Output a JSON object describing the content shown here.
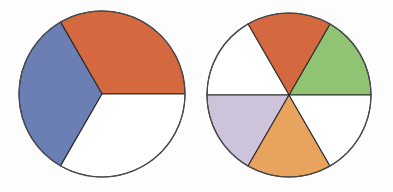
{
  "figure": {
    "background_color": "#fdfdfd",
    "outline_color": "#4a4a52",
    "sector_stroke_color": "#2b2b2b",
    "width": 393,
    "height": 192
  },
  "chart_data": {
    "type": "pie",
    "xlabel": "",
    "ylabel": "",
    "charts": [
      {
        "name": "left-circle",
        "label": "Circle divided into thirds",
        "center_x": 102,
        "center_y": 94,
        "radius": 83,
        "total_sectors": 3,
        "shaded_sectors": 2,
        "fraction": "2/3",
        "start_angle_deg": 0,
        "categories": [
          "orange-sector",
          "blue-sector",
          "white-sector"
        ],
        "values": [
          120,
          120,
          120
        ],
        "series": [
          {
            "name": "sectors",
            "values": [
              {
                "label": "orange-sector",
                "start_deg": 0,
                "end_deg": 120,
                "sweep_deg": 120,
                "color": "#d4693f",
                "shaded": true
              },
              {
                "label": "blue-sector",
                "start_deg": 120,
                "end_deg": 240,
                "sweep_deg": 120,
                "color": "#6b7fb5",
                "shaded": true
              },
              {
                "label": "white-sector",
                "start_deg": 240,
                "end_deg": 360,
                "sweep_deg": 120,
                "color": "#ffffff",
                "shaded": false
              }
            ]
          }
        ]
      },
      {
        "name": "right-circle",
        "label": "Circle divided into sixths",
        "center_x": 289,
        "center_y": 95,
        "radius": 82,
        "total_sectors": 6,
        "shaded_sectors": 4,
        "fraction": "4/6",
        "start_angle_deg": 0,
        "categories": [
          "green-sector",
          "orange-sector",
          "white-sector-upper-left",
          "lavender-sector",
          "light-orange-sector",
          "white-sector-lower-right"
        ],
        "values": [
          60,
          60,
          60,
          60,
          60,
          60
        ],
        "series": [
          {
            "name": "sectors",
            "values": [
              {
                "label": "green-sector",
                "start_deg": 0,
                "end_deg": 60,
                "sweep_deg": 60,
                "color": "#90c473",
                "shaded": true
              },
              {
                "label": "orange-sector",
                "start_deg": 60,
                "end_deg": 120,
                "sweep_deg": 60,
                "color": "#d4693f",
                "shaded": true
              },
              {
                "label": "white-sector-upper-left",
                "start_deg": 120,
                "end_deg": 180,
                "sweep_deg": 60,
                "color": "#ffffff",
                "shaded": false
              },
              {
                "label": "lavender-sector",
                "start_deg": 180,
                "end_deg": 240,
                "sweep_deg": 60,
                "color": "#cdc3da",
                "shaded": true
              },
              {
                "label": "light-orange-sector",
                "start_deg": 240,
                "end_deg": 300,
                "sweep_deg": 60,
                "color": "#e8a35e",
                "shaded": true
              },
              {
                "label": "white-sector-lower-right",
                "start_deg": 300,
                "end_deg": 360,
                "sweep_deg": 60,
                "color": "#ffffff",
                "shaded": false
              }
            ]
          }
        ]
      }
    ],
    "legend_position": "none",
    "grid": false
  }
}
